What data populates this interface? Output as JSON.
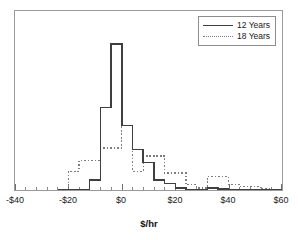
{
  "chart_data": {
    "type": "line",
    "subtype": "step-histogram",
    "title": "",
    "xlabel": "$/hr",
    "ylabel": "",
    "xlim": [
      -40,
      60
    ],
    "ylim": [
      0,
      1
    ],
    "grid": false,
    "xticks": [
      -40,
      -20,
      0,
      20,
      40,
      60
    ],
    "xtick_labels": [
      "-$40",
      "-$20",
      "$0",
      "$20",
      "$40",
      "$60"
    ],
    "minor_tick_interval": 4,
    "yaxis_ticks": false,
    "legend_position": "top-right",
    "bin_width": 4,
    "bin_edges": [
      -24,
      -20,
      -16,
      -12,
      -8,
      -4,
      0,
      4,
      8,
      12,
      16,
      20,
      24,
      28,
      32,
      36,
      40,
      44,
      48,
      52,
      56,
      60
    ],
    "series": [
      {
        "name": "12 Years",
        "style": "solid",
        "color": "#3f3f3f",
        "values": [
          0,
          0,
          0,
          0.055,
          0.46,
          0.815,
          0.36,
          0.225,
          0.155,
          0.055,
          0.035,
          0.012,
          0.004,
          0.004,
          0.012,
          0.006,
          0.003,
          0.002,
          0,
          0,
          0
        ]
      },
      {
        "name": "18 Years",
        "style": "dotted",
        "color": "#7d7d7d",
        "values": [
          0,
          0.105,
          0.165,
          0.165,
          0.235,
          0.235,
          0.36,
          0.105,
          0.19,
          0.19,
          0.095,
          0.095,
          0.03,
          0.012,
          0.075,
          0.075,
          0.03,
          0.018,
          0.018,
          0.005,
          0.002
        ]
      }
    ]
  },
  "legend": {
    "items": [
      {
        "label": "12 Years",
        "style": "solid"
      },
      {
        "label": "18 Years",
        "style": "dotted"
      }
    ]
  },
  "axis": {
    "title": "$/hr",
    "tick_labels": [
      "-$40",
      "-$20",
      "$0",
      "$20",
      "$40",
      "$60"
    ]
  }
}
